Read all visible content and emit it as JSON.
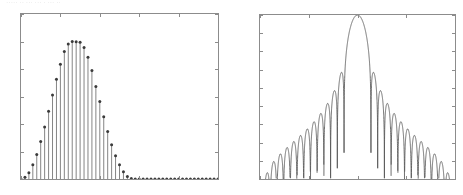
{
  "figure": {
    "artifact_text": "·····  ·· ···        ··· · ··· ··",
    "background": "#ffffff",
    "axis_color": "#8c8c8c",
    "curve_color": "#555555",
    "stem_color": "#777777",
    "marker_color": "#3b3b3b"
  },
  "chart_data": [
    {
      "type": "bar",
      "subtype": "stem",
      "id": "window-time-domain",
      "title": "",
      "xlabel": "",
      "ylabel": "",
      "xlim": [
        0,
        50
      ],
      "ylim": [
        0,
        1.2
      ],
      "grid": false,
      "legend": null,
      "xticks": [
        0,
        10,
        20,
        30,
        40,
        50
      ],
      "xticklabels": [
        "0",
        "10",
        "20",
        "30",
        "40",
        "50"
      ],
      "yticks": [
        0,
        0.2,
        0.4,
        0.6,
        0.8,
        1,
        1.2
      ],
      "yticklabels": [
        "0",
        "0.2",
        "0.4",
        "0.6",
        "0.8",
        "1",
        "1.2"
      ],
      "marker": "dot",
      "categories": [
        0,
        1,
        2,
        3,
        4,
        5,
        6,
        7,
        8,
        9,
        10,
        11,
        12,
        13,
        14,
        15,
        16,
        17,
        18,
        19,
        20,
        21,
        22,
        23,
        24,
        25,
        26,
        27,
        28,
        29,
        30,
        31,
        32,
        33,
        34,
        35,
        36,
        37,
        38,
        39,
        40,
        41,
        42,
        43,
        44,
        45,
        46,
        47,
        48,
        49,
        50
      ],
      "values": [
        0.0,
        0.012,
        0.046,
        0.103,
        0.179,
        0.273,
        0.378,
        0.492,
        0.611,
        0.726,
        0.835,
        0.927,
        0.981,
        1.0,
        0.999,
        0.994,
        0.956,
        0.886,
        0.789,
        0.673,
        0.563,
        0.452,
        0.345,
        0.25,
        0.17,
        0.104,
        0.052,
        0.018,
        0.004,
        0.0,
        0.0,
        0.0,
        0.0,
        0.0,
        0.0,
        0.0,
        0.0,
        0.0,
        0.0,
        0.0,
        0.0,
        0.0,
        0.0,
        0.0,
        0.0,
        0.0,
        0.0,
        0.0,
        0.0,
        0.0,
        0.0
      ]
    },
    {
      "type": "line",
      "id": "window-frequency-response",
      "title": "",
      "xlabel": "",
      "ylabel": "",
      "xlim": [
        -3.14159265,
        3.14159265
      ],
      "ylim": [
        -90,
        0
      ],
      "grid": false,
      "legend": null,
      "xticks": [
        -3.14159265,
        -1.57079633,
        0,
        1.57079633,
        3.14159265
      ],
      "xticklabels": [
        "−π",
        "−π/2",
        "0",
        "π/2",
        "π"
      ],
      "yticks": [
        0,
        -10,
        -20,
        -30,
        -40,
        -50,
        -60,
        -70,
        -80,
        -90
      ],
      "yticklabels": [
        "0",
        "−10",
        "−20",
        "−30",
        "−40",
        "−50",
        "−60",
        "−70",
        "−80",
        "−90"
      ],
      "mainlobe_peak_db": 0,
      "first_sidelobe_db": -31,
      "window_length": 30,
      "window_type": "hann"
    }
  ]
}
